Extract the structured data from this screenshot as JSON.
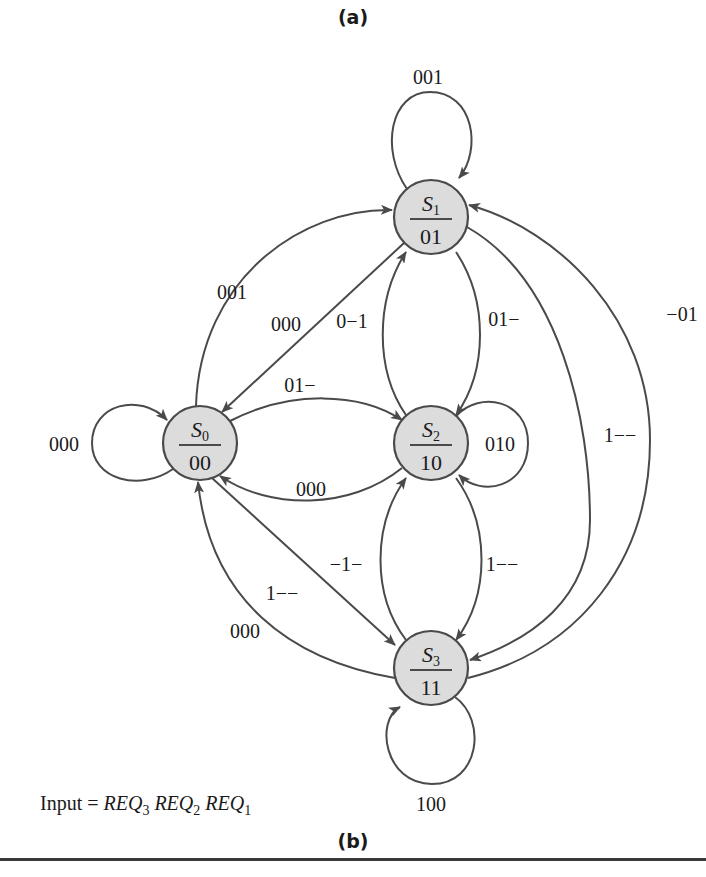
{
  "figure": {
    "label_top": "(a)",
    "label_bottom": "(b)",
    "input_label": {
      "prefix": "Input = ",
      "vars": [
        {
          "name": "REQ",
          "sub": "3"
        },
        {
          "name": "REQ",
          "sub": "2"
        },
        {
          "name": "REQ",
          "sub": "1"
        }
      ]
    }
  },
  "states": [
    {
      "id": "S0",
      "name": "S",
      "sub": "0",
      "output": "00"
    },
    {
      "id": "S1",
      "name": "S",
      "sub": "1",
      "output": "01"
    },
    {
      "id": "S2",
      "name": "S",
      "sub": "2",
      "output": "10"
    },
    {
      "id": "S3",
      "name": "S",
      "sub": "3",
      "output": "11"
    }
  ],
  "transitions": [
    {
      "from": "S0",
      "to": "S0",
      "label": "000"
    },
    {
      "from": "S0",
      "to": "S1",
      "label": "001"
    },
    {
      "from": "S1",
      "to": "S0",
      "label": "000"
    },
    {
      "from": "S0",
      "to": "S2",
      "label": "01−"
    },
    {
      "from": "S2",
      "to": "S0",
      "label": "000"
    },
    {
      "from": "S0",
      "to": "S3",
      "label": "1−−"
    },
    {
      "from": "S3",
      "to": "S0",
      "label": "000"
    },
    {
      "from": "S1",
      "to": "S1",
      "label": "001"
    },
    {
      "from": "S2",
      "to": "S1",
      "label": "0−1"
    },
    {
      "from": "S1",
      "to": "S2",
      "label": "01−"
    },
    {
      "from": "S1",
      "to": "S3",
      "label": "1−−"
    },
    {
      "from": "S3",
      "to": "S1",
      "label": "−01"
    },
    {
      "from": "S2",
      "to": "S2",
      "label": "010"
    },
    {
      "from": "S3",
      "to": "S2",
      "label": "−1−"
    },
    {
      "from": "S2",
      "to": "S3",
      "label": "1−−"
    },
    {
      "from": "S3",
      "to": "S3",
      "label": "100"
    }
  ]
}
